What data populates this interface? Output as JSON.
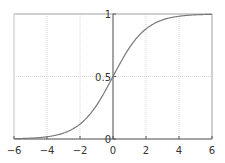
{
  "chart_data": {
    "type": "line",
    "title": "",
    "xlabel": "",
    "ylabel": "",
    "xlim": [
      -6,
      6
    ],
    "ylim": [
      0,
      1
    ],
    "grid": true,
    "legend": null,
    "x_ticks": [
      "-6",
      "-4",
      "-2",
      "0",
      "2",
      "4",
      "6"
    ],
    "y_ticks": [
      "0",
      "0.5",
      "1"
    ],
    "series": [
      {
        "name": "sigmoid",
        "function": "1/(1+exp(-x))",
        "x": [
          -6,
          -5,
          -4,
          -3,
          -2,
          -1,
          0,
          1,
          2,
          3,
          4,
          5,
          6
        ],
        "values": [
          0.0025,
          0.0067,
          0.018,
          0.047,
          0.119,
          0.269,
          0.5,
          0.731,
          0.881,
          0.953,
          0.982,
          0.9933,
          0.9975
        ],
        "color": "#7a7a7a"
      }
    ]
  },
  "colors": {
    "curve": "#7a7a7a",
    "axis": "#555555",
    "grid": "#cccccc",
    "border": "#aaaaaa"
  }
}
